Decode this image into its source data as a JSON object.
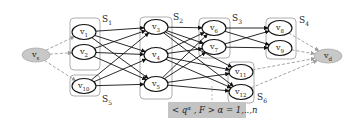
{
  "diagram": {
    "source_node": {
      "id": "vs",
      "label": "v",
      "sub": "s",
      "x": 36,
      "y": 55
    },
    "dest_node": {
      "id": "vd",
      "label": "v",
      "sub": "d",
      "x": 328,
      "y": 56
    },
    "sets": [
      {
        "id": "S1",
        "label": "S",
        "sub": "1",
        "box": [
          70,
          18,
          30,
          52
        ],
        "lx": 102,
        "ly": 22
      },
      {
        "id": "S5",
        "label": "S",
        "sub": "5",
        "box": [
          70,
          75,
          30,
          21
        ],
        "lx": 102,
        "ly": 102
      },
      {
        "id": "S2",
        "label": "S",
        "sub": "2",
        "box": [
          140,
          17,
          32,
          82
        ],
        "lx": 173,
        "ly": 20
      },
      {
        "id": "S3",
        "label": "S",
        "sub": "3",
        "box": [
          199,
          18,
          31,
          40
        ],
        "lx": 232,
        "ly": 21
      },
      {
        "id": "S4",
        "label": "S",
        "sub": "4",
        "box": [
          266,
          18,
          30,
          41
        ],
        "lx": 299,
        "ly": 23
      },
      {
        "id": "S6",
        "label": "S",
        "sub": "6",
        "box": [
          228,
          62,
          26,
          41
        ],
        "lx": 257,
        "ly": 100
      }
    ],
    "nodes": [
      {
        "id": "v1",
        "label": "v",
        "sub": "1",
        "x": 84,
        "y": 32
      },
      {
        "id": "v2",
        "label": "v",
        "sub": "2",
        "x": 84,
        "y": 52
      },
      {
        "id": "v10",
        "label": "v",
        "sub": "10",
        "x": 84,
        "y": 86
      },
      {
        "id": "v3",
        "label": "v",
        "sub": "3",
        "x": 156,
        "y": 27
      },
      {
        "id": "v4",
        "label": "v",
        "sub": "4",
        "x": 156,
        "y": 55
      },
      {
        "id": "v5",
        "label": "v",
        "sub": "5",
        "x": 156,
        "y": 84
      },
      {
        "id": "v6",
        "label": "v",
        "sub": "6",
        "x": 214,
        "y": 28
      },
      {
        "id": "v7",
        "label": "v",
        "sub": "7",
        "x": 214,
        "y": 47
      },
      {
        "id": "v8",
        "label": "v",
        "sub": "8",
        "x": 280,
        "y": 28
      },
      {
        "id": "v9",
        "label": "v",
        "sub": "9",
        "x": 280,
        "y": 48
      },
      {
        "id": "v11",
        "label": "v",
        "sub": "11",
        "x": 241,
        "y": 72
      },
      {
        "id": "v12",
        "label": "v",
        "sub": "12",
        "x": 241,
        "y": 92
      }
    ],
    "dashed_edges": [
      [
        "vs",
        "v1"
      ],
      [
        "vs",
        "v2"
      ],
      [
        "vs",
        "v10"
      ],
      [
        "v8",
        "vd"
      ],
      [
        "v9",
        "vd"
      ],
      [
        "v11",
        "vd"
      ],
      [
        "v12",
        "vd"
      ]
    ],
    "solid_edges": [
      [
        "v1",
        "v3"
      ],
      [
        "v1",
        "v4"
      ],
      [
        "v1",
        "v5"
      ],
      [
        "v2",
        "v3"
      ],
      [
        "v2",
        "v4"
      ],
      [
        "v2",
        "v5"
      ],
      [
        "v10",
        "v3"
      ],
      [
        "v10",
        "v4"
      ],
      [
        "v10",
        "v5"
      ],
      [
        "v3",
        "v6"
      ],
      [
        "v3",
        "v7"
      ],
      [
        "v3",
        "v11"
      ],
      [
        "v3",
        "v12"
      ],
      [
        "v4",
        "v6"
      ],
      [
        "v4",
        "v7"
      ],
      [
        "v4",
        "v11"
      ],
      [
        "v4",
        "v12"
      ],
      [
        "v5",
        "v6"
      ],
      [
        "v5",
        "v7"
      ],
      [
        "v5",
        "v11"
      ],
      [
        "v5",
        "v12"
      ],
      [
        "v6",
        "v8"
      ],
      [
        "v6",
        "v9"
      ],
      [
        "v7",
        "v8"
      ],
      [
        "v7",
        "v9"
      ]
    ],
    "formula_label": {
      "text": "< q",
      "sup": "α",
      "rest": " , F > α = 1,..,n",
      "box": [
        168,
        102,
        78,
        16
      ]
    },
    "colors": {
      "terminal_fill": "#c8c8c8",
      "terminal_stroke": "#aaaaaa",
      "set_box": "#999999",
      "dashed": "#999999",
      "edge": "#111111",
      "formula_bg": "#c4c4c4"
    }
  }
}
